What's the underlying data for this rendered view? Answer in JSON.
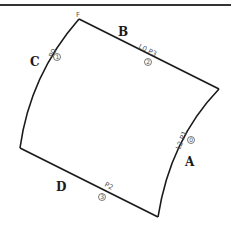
{
  "diagram": {
    "vertex_label": "F",
    "edges": [
      {
        "id": "A",
        "label": "A"
      },
      {
        "id": "B",
        "label": "B"
      },
      {
        "id": "C",
        "label": "C"
      },
      {
        "id": "D",
        "label": "D"
      }
    ],
    "annotations": [
      {
        "text": "P0",
        "marker": "1"
      },
      {
        "text": "L0 P3",
        "marker": "2"
      },
      {
        "text": "L2 P1",
        "marker": "0"
      },
      {
        "text": "P2",
        "marker": "3"
      }
    ],
    "colors": {
      "stroke": "#1a1a1a",
      "annotation": "#555555",
      "background": "#ffffff"
    }
  }
}
